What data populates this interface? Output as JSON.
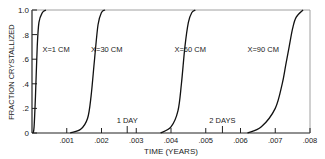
{
  "chart_data": {
    "type": "line",
    "title": "",
    "xlabel": "TIME (YEARS)",
    "ylabel": "FRACTION CRYSTALLIZED",
    "xlim": [
      0,
      0.008
    ],
    "ylim": [
      0,
      1.0
    ],
    "grid": false,
    "x_ticks": [
      {
        "value": 0.001,
        "label": ".001"
      },
      {
        "value": 0.002,
        "label": ".002"
      },
      {
        "value": 0.003,
        "label": ".003"
      },
      {
        "value": 0.004,
        "label": ".004"
      },
      {
        "value": 0.005,
        "label": ".005"
      },
      {
        "value": 0.006,
        "label": ".006"
      },
      {
        "value": 0.007,
        "label": ".007"
      },
      {
        "value": 0.008,
        "label": ".008"
      }
    ],
    "y_ticks": [
      {
        "value": 0,
        "label": "0"
      },
      {
        "value": 0.2,
        "label": ".2"
      },
      {
        "value": 0.4,
        "label": ".4"
      },
      {
        "value": 0.6,
        "label": ".6"
      },
      {
        "value": 0.8,
        "label": ".8"
      },
      {
        "value": 1.0,
        "label": "1.0"
      }
    ],
    "annotations": [
      {
        "text": "1 DAY",
        "x": 0.00274
      },
      {
        "text": "2 DAYS",
        "x": 0.00548
      }
    ],
    "series": [
      {
        "name": "X=1 CM",
        "x": [
          3e-05,
          6e-05,
          0.0001,
          0.00015,
          0.0002,
          0.0003,
          0.0004
        ],
        "y": [
          0,
          0.05,
          0.3,
          0.7,
          0.9,
          0.98,
          1.0
        ]
      },
      {
        "name": "X=30 CM",
        "x": [
          0.0011,
          0.0014,
          0.0016,
          0.0017,
          0.0018,
          0.0019,
          0.002,
          0.0021
        ],
        "y": [
          0,
          0.03,
          0.12,
          0.3,
          0.6,
          0.88,
          0.98,
          1.0
        ]
      },
      {
        "name": "X=60 CM",
        "x": [
          0.0037,
          0.004,
          0.0042,
          0.0043,
          0.0044,
          0.0045,
          0.0046,
          0.0047
        ],
        "y": [
          0,
          0.05,
          0.18,
          0.4,
          0.7,
          0.9,
          0.98,
          1.0
        ]
      },
      {
        "name": "X=90 CM",
        "x": [
          0.0062,
          0.0066,
          0.007,
          0.0072,
          0.0073,
          0.0074,
          0.0075,
          0.0076,
          0.0078
        ],
        "y": [
          0,
          0.05,
          0.2,
          0.4,
          0.55,
          0.7,
          0.85,
          0.94,
          1.0
        ]
      }
    ],
    "series_label_positions": [
      {
        "name": "X=1 CM",
        "x": 0.0003,
        "y": 0.68
      },
      {
        "name": "X=30 CM",
        "x": 0.0017,
        "y": 0.68
      },
      {
        "name": "X=60 CM",
        "x": 0.0041,
        "y": 0.68
      },
      {
        "name": "X=90 CM",
        "x": 0.0062,
        "y": 0.68
      }
    ]
  }
}
